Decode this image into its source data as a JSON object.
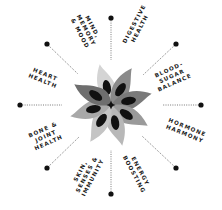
{
  "diagram": {
    "center": {
      "x": 111,
      "y": 105
    },
    "colors": {
      "dot": "#111111",
      "connector": "#555555",
      "petal_light": "#cfcfcf",
      "petal_mid": "#a3a3a3",
      "petal_dark": "#7a7a7a",
      "seed": "#111111",
      "text": "#1a1a1a"
    },
    "nodes": [
      {
        "id": "mind",
        "label": "MIND,\nMEMORY\n& MOOD"
      },
      {
        "id": "digestive",
        "label": "DIGESTIVE\nHEALTH"
      },
      {
        "id": "blood-sugar",
        "label": "BLOOD-\nSUGAR\nBALANCE"
      },
      {
        "id": "hormone",
        "label": "HORMONE\nHARMONY"
      },
      {
        "id": "energy",
        "label": "ENERGY\nBOOSTING"
      },
      {
        "id": "skin",
        "label": "SKIN,\nSENSES &\nIMMUNITY"
      },
      {
        "id": "bone",
        "label": "BONE &\nJOINT\nHEALTH"
      },
      {
        "id": "heart",
        "label": "HEART\nHEALTH"
      }
    ]
  }
}
